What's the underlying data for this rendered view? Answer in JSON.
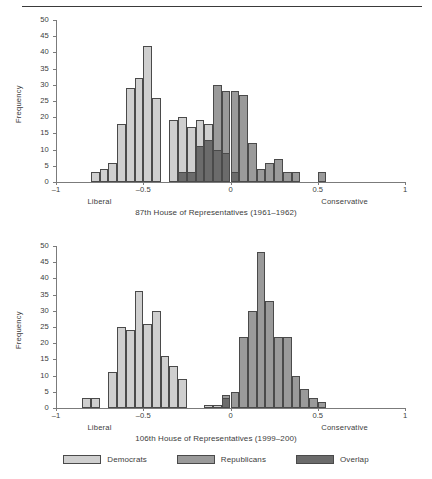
{
  "figure": {
    "top_rule": true,
    "colors": {
      "democrats": "#cfcfcf",
      "republicans": "#9a9a9a",
      "overlap": "#6b6b6b",
      "axis": "#7b7b7b",
      "bar_border": "#4a4a4a",
      "text": "#3c3c3c"
    },
    "legend": {
      "items": [
        {
          "label": "Democrats",
          "color_key": "democrats"
        },
        {
          "label": "Republicans",
          "color_key": "republicans"
        },
        {
          "label": "Overlap",
          "color_key": "overlap"
        }
      ]
    }
  },
  "chart_data": [
    {
      "type": "bar",
      "id": "top",
      "title": "87th House of Representatives (1961–1962)",
      "xlabel": "",
      "ylabel": "Frequency",
      "left_end_label": "Liberal",
      "right_end_label": "Conservative",
      "xlim": [
        -1,
        1
      ],
      "ylim": [
        0,
        50
      ],
      "xticks": [
        -1,
        -0.5,
        0,
        0.5,
        1
      ],
      "xticklabels": [
        "–1",
        "–0.5",
        "0",
        "0.5",
        "1"
      ],
      "yticks": [
        0,
        5,
        10,
        15,
        20,
        25,
        30,
        35,
        40,
        45,
        50
      ],
      "yticklabels": [
        "0",
        "5",
        "10",
        "15",
        "20",
        "25",
        "30",
        "35",
        "40",
        "45",
        "50"
      ],
      "grid": false,
      "bin_width": 0.05,
      "bars": [
        {
          "x0": -0.8,
          "value": 3,
          "series": "Democrats"
        },
        {
          "x0": -0.75,
          "value": 4,
          "series": "Democrats"
        },
        {
          "x0": -0.7,
          "value": 6,
          "series": "Democrats"
        },
        {
          "x0": -0.65,
          "value": 18,
          "series": "Democrats"
        },
        {
          "x0": -0.6,
          "value": 29,
          "series": "Democrats"
        },
        {
          "x0": -0.55,
          "value": 32,
          "series": "Democrats"
        },
        {
          "x0": -0.5,
          "value": 42,
          "series": "Democrats"
        },
        {
          "x0": -0.45,
          "value": 26,
          "series": "Democrats"
        },
        {
          "x0": -0.35,
          "value": 19,
          "series": "Democrats"
        },
        {
          "x0": -0.3,
          "value": 20,
          "series": "Democrats"
        },
        {
          "x0": -0.25,
          "value": 17,
          "series": "Democrats"
        },
        {
          "x0": -0.2,
          "value": 19,
          "series": "Democrats"
        },
        {
          "x0": -0.15,
          "value": 18,
          "series": "Democrats"
        },
        {
          "x0": -0.3,
          "value": 3,
          "series": "Overlap"
        },
        {
          "x0": -0.25,
          "value": 3,
          "series": "Overlap"
        },
        {
          "x0": -0.2,
          "value": 11,
          "series": "Overlap"
        },
        {
          "x0": -0.15,
          "value": 13,
          "series": "Overlap"
        },
        {
          "x0": -0.1,
          "value": 30,
          "series": "Republicans"
        },
        {
          "x0": -0.05,
          "value": 28,
          "series": "Republicans"
        },
        {
          "x0": 0.0,
          "value": 28,
          "series": "Republicans"
        },
        {
          "x0": 0.05,
          "value": 27,
          "series": "Republicans"
        },
        {
          "x0": -0.1,
          "value": 10,
          "series": "Overlap"
        },
        {
          "x0": -0.05,
          "value": 9,
          "series": "Overlap"
        },
        {
          "x0": 0.0,
          "value": 3,
          "series": "Overlap"
        },
        {
          "x0": 0.1,
          "value": 12,
          "series": "Republicans"
        },
        {
          "x0": 0.15,
          "value": 4,
          "series": "Republicans"
        },
        {
          "x0": 0.2,
          "value": 6,
          "series": "Republicans"
        },
        {
          "x0": 0.25,
          "value": 7,
          "series": "Republicans"
        },
        {
          "x0": 0.3,
          "value": 3,
          "series": "Republicans"
        },
        {
          "x0": 0.35,
          "value": 3,
          "series": "Republicans"
        },
        {
          "x0": 0.5,
          "value": 3,
          "series": "Republicans"
        }
      ]
    },
    {
      "type": "bar",
      "id": "bottom",
      "title": "106th House of Representatives (1999–200)",
      "xlabel": "",
      "ylabel": "Frequency",
      "left_end_label": "Liberal",
      "right_end_label": "Conservative",
      "xlim": [
        -1,
        1
      ],
      "ylim": [
        0,
        50
      ],
      "xticks": [
        -1,
        -0.5,
        0,
        0.5,
        1
      ],
      "xticklabels": [
        "–1",
        "–0.5",
        "0",
        "0.5",
        "1"
      ],
      "yticks": [
        0,
        5,
        10,
        15,
        20,
        25,
        30,
        35,
        40,
        45,
        50
      ],
      "yticklabels": [
        "0",
        "5",
        "10",
        "15",
        "20",
        "25",
        "30",
        "35",
        "40",
        "45",
        "50"
      ],
      "grid": false,
      "bin_width": 0.05,
      "bars": [
        {
          "x0": -0.85,
          "value": 3,
          "series": "Democrats"
        },
        {
          "x0": -0.8,
          "value": 3,
          "series": "Democrats"
        },
        {
          "x0": -0.7,
          "value": 11,
          "series": "Democrats"
        },
        {
          "x0": -0.65,
          "value": 25,
          "series": "Democrats"
        },
        {
          "x0": -0.6,
          "value": 24,
          "series": "Democrats"
        },
        {
          "x0": -0.55,
          "value": 36,
          "series": "Democrats"
        },
        {
          "x0": -0.5,
          "value": 26,
          "series": "Democrats"
        },
        {
          "x0": -0.45,
          "value": 30,
          "series": "Democrats"
        },
        {
          "x0": -0.4,
          "value": 16,
          "series": "Democrats"
        },
        {
          "x0": -0.35,
          "value": 13,
          "series": "Democrats"
        },
        {
          "x0": -0.3,
          "value": 9,
          "series": "Democrats"
        },
        {
          "x0": -0.15,
          "value": 1,
          "series": "Democrats"
        },
        {
          "x0": -0.1,
          "value": 1,
          "series": "Democrats"
        },
        {
          "x0": -0.05,
          "value": 4,
          "series": "Republicans"
        },
        {
          "x0": -0.05,
          "value": 3,
          "series": "Overlap"
        },
        {
          "x0": 0.0,
          "value": 5,
          "series": "Republicans"
        },
        {
          "x0": 0.05,
          "value": 22,
          "series": "Republicans"
        },
        {
          "x0": 0.1,
          "value": 30,
          "series": "Republicans"
        },
        {
          "x0": 0.15,
          "value": 48,
          "series": "Republicans"
        },
        {
          "x0": 0.2,
          "value": 33,
          "series": "Republicans"
        },
        {
          "x0": 0.25,
          "value": 22,
          "series": "Republicans"
        },
        {
          "x0": 0.3,
          "value": 22,
          "series": "Republicans"
        },
        {
          "x0": 0.35,
          "value": 10,
          "series": "Republicans"
        },
        {
          "x0": 0.4,
          "value": 6,
          "series": "Republicans"
        },
        {
          "x0": 0.45,
          "value": 3,
          "series": "Republicans"
        },
        {
          "x0": 0.5,
          "value": 2,
          "series": "Republicans"
        }
      ]
    }
  ]
}
